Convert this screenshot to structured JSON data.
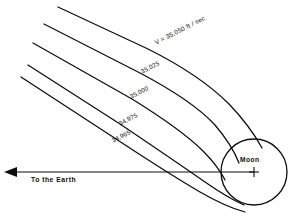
{
  "figure": {
    "type": "lunar-trajectory-diagram",
    "background_color": "#ffffff",
    "ink_color": "#0d0d0d",
    "width": 302,
    "height": 218
  },
  "moon": {
    "label": "Moon",
    "center_marker": "plus-crosshair",
    "center_x": 254,
    "center_y": 172,
    "radius": 33
  },
  "earth_axis": {
    "label": "To the Earth",
    "direction": "left",
    "arrow": "left-arrow",
    "y": 172
  },
  "trajectories": [
    {
      "id": "traj-1",
      "label": "V = 35,050 ft / sec",
      "velocity": 35050,
      "units": "ft/sec",
      "label_x": 155,
      "label_y": 43,
      "label_rotation": -27
    },
    {
      "id": "traj-2",
      "label": "35,025",
      "velocity": 35025,
      "units": "ft/sec",
      "label_x": 141,
      "label_y": 72,
      "label_rotation": -27
    },
    {
      "id": "traj-3",
      "label": "35,000",
      "velocity": 35000,
      "units": "ft/sec",
      "label_x": 130,
      "label_y": 97,
      "label_rotation": -27
    },
    {
      "id": "traj-4",
      "label": "34,975",
      "velocity": 34975,
      "units": "ft/sec",
      "label_x": 119,
      "label_y": 124,
      "label_rotation": -27
    },
    {
      "id": "traj-5",
      "label": "34,965",
      "velocity": 34965,
      "units": "ft/sec",
      "label_x": 112,
      "label_y": 141,
      "label_rotation": -27
    }
  ]
}
